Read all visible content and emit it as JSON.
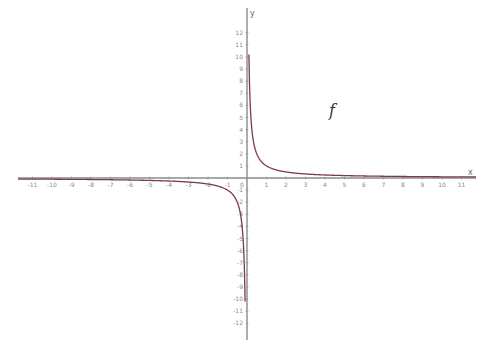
{
  "chart_data": {
    "type": "line",
    "title": "",
    "function_label": "f",
    "expression": "f(x) = 1/x",
    "xlabel": "x",
    "ylabel": "y",
    "xlim": [
      -12,
      12
    ],
    "ylim": [
      -13,
      13
    ],
    "x_ticks": [
      -11,
      -10,
      -9,
      -8,
      -7,
      -6,
      -5,
      -4,
      -3,
      -2,
      -1,
      0,
      1,
      2,
      3,
      4,
      5,
      6,
      7,
      8,
      9,
      10,
      11
    ],
    "y_ticks": [
      -12,
      -11,
      -10,
      -9,
      -8,
      -7,
      -6,
      -5,
      -4,
      -3,
      -2,
      -1,
      1,
      2,
      3,
      4,
      5,
      6,
      7,
      8,
      9,
      10,
      11,
      12
    ],
    "grid": false,
    "legend": null,
    "series": [
      {
        "name": "f",
        "color": "#7a3a48",
        "x": [
          -11.8,
          -10,
          -8,
          -6,
          -5,
          -4,
          -3,
          -2,
          -1.5,
          -1,
          -0.75,
          -0.5,
          -0.3,
          -0.2,
          -0.15,
          -0.1,
          -0.08,
          0.08,
          0.1,
          0.15,
          0.2,
          0.3,
          0.5,
          0.75,
          1,
          1.5,
          2,
          3,
          4,
          5,
          6,
          8,
          10,
          11.8
        ],
        "y": [
          -0.085,
          -0.1,
          -0.125,
          -0.167,
          -0.2,
          -0.25,
          -0.333,
          -0.5,
          -0.667,
          -1,
          -1.333,
          -2,
          -3.333,
          -5,
          -6.667,
          -10,
          -12.5,
          12.5,
          10,
          6.667,
          5,
          3.333,
          2,
          1.333,
          1,
          0.667,
          0.5,
          0.333,
          0.25,
          0.2,
          0.167,
          0.125,
          0.1,
          0.085
        ]
      }
    ]
  },
  "colors": {
    "axis": "#8a8a8a",
    "curve": "#7a3a48",
    "tick_label": "#888888"
  },
  "layout": {
    "origin_px": [
      247,
      178
    ],
    "x_unit_px": 19.5,
    "y_unit_px": 12.1,
    "x_axis_px": [
      18,
      476
    ],
    "y_axis_px": [
      8,
      340
    ],
    "fn_label_px": [
      329,
      116
    ]
  }
}
